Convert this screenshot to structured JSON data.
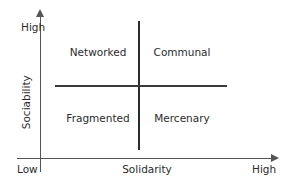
{
  "diagram": {
    "type": "two-by-two-matrix",
    "axes": {
      "x": {
        "label": "Solidarity",
        "low_label": "Low",
        "high_label": "High"
      },
      "y": {
        "label": "Sociability",
        "high_label": "High"
      }
    },
    "quadrants": [
      {
        "id": "networked",
        "label": "Networked",
        "sociability": "High",
        "solidarity": "Low"
      },
      {
        "id": "communal",
        "label": "Communal",
        "sociability": "High",
        "solidarity": "High"
      },
      {
        "id": "fragmented",
        "label": "Fragmented",
        "sociability": "Low",
        "solidarity": "Low"
      },
      {
        "id": "mercenary",
        "label": "Mercenary",
        "sociability": "Low",
        "solidarity": "High"
      }
    ],
    "colors": {
      "background": "#ffffff",
      "axis": "#555555",
      "divider": "#2b2b2b",
      "text": "#2b2b2b"
    }
  }
}
